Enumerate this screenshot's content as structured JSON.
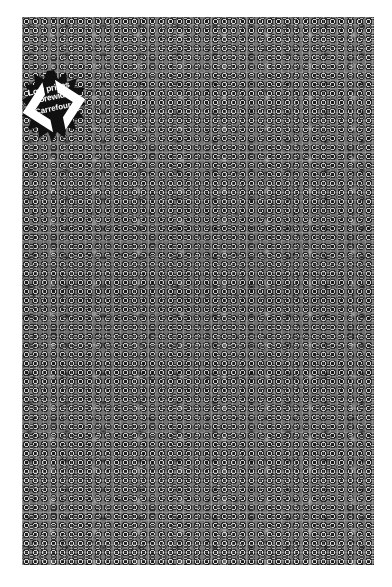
{
  "poster": {
    "description": "Dense grayscale collage of tiny product photos",
    "background_color": "#ffffff",
    "collage_base_color": "#7d7d7d"
  },
  "badge": {
    "line1": "Low prices",
    "line2": "storewide",
    "brand": "Carrefour",
    "logo_icon": "carrefour-logo-icon",
    "fill_color": "#111111",
    "text_color": "#ffffff"
  }
}
